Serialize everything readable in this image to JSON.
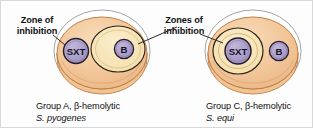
{
  "figure": {
    "width": 313,
    "height": 128,
    "background": "#fdfdfd",
    "border_color": "#d8d8d8"
  },
  "annotations": {
    "left": {
      "line1": "Zone of",
      "line2": "inhibition"
    },
    "right": {
      "line1": "Zones of",
      "line2": "inhibition"
    }
  },
  "plates": [
    {
      "id": "plate-group-a",
      "caption_line1": "Group A, β-hemolytic",
      "caption_species": "S. pyogenes",
      "disks": [
        {
          "label": "SXT",
          "has_zone": false
        },
        {
          "label": "B",
          "has_zone": true
        }
      ]
    },
    {
      "id": "plate-group-c",
      "caption_line1": "Group C, β-hemolytic",
      "caption_species": "S. equi",
      "disks": [
        {
          "label": "SXT",
          "has_zone": true
        },
        {
          "label": "B",
          "has_zone": false
        }
      ]
    }
  ],
  "colors": {
    "agar": "#f0c392",
    "agar_highlight": "#f6d7b2",
    "zone": "#f7e3b4",
    "zone_outline": "#2b2416",
    "disk_fill": "#a99bc8",
    "disk_outline": "#241f2e",
    "plate_rim": "#c9945e",
    "leader_line": "#2a2a2a",
    "glass_rim": "#8a8a8a",
    "text": "#111111"
  }
}
